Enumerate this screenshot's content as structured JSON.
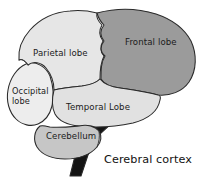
{
  "figure": {
    "background_color": "#ffffff",
    "outline_color": "#2a2a2a"
  },
  "caption": {
    "text": "Cerebral cortex",
    "color": "#111111"
  },
  "regions": [
    {
      "id": "frontal-lobe",
      "label": "Frontal lobe",
      "fill": "#9b9b9b",
      "label_x": 139,
      "label_y": 43
    },
    {
      "id": "parietal-lobe",
      "label": "Parietal lobe",
      "fill": "#e6e6e6",
      "label_x": 33,
      "label_y": 56
    },
    {
      "id": "occipital-lobe",
      "label_line1": "Occipital",
      "label_line2": "lobe",
      "fill": "#ededed",
      "label_x": 13,
      "label_y": 93
    },
    {
      "id": "temporal-lobe",
      "label": "Temporal Lobe",
      "fill": "#e1e1e1",
      "label_x": 63,
      "label_y": 105
    },
    {
      "id": "cerebellum",
      "label": "Cerebellum",
      "fill": "#c6c6c6",
      "label_x": 44,
      "label_y": 135
    },
    {
      "id": "brainstem",
      "label": "",
      "fill": "#141414",
      "label_x": 0,
      "label_y": 0
    }
  ]
}
